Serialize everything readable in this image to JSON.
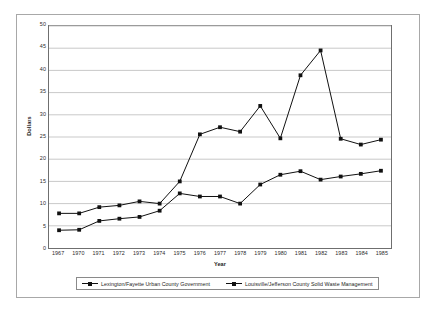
{
  "chart_data": {
    "type": "line",
    "title": "",
    "xlabel": "Year",
    "ylabel": "Dollars",
    "ylim": [
      0,
      50
    ],
    "ytick_step": 5,
    "yticks": [
      0,
      5,
      10,
      15,
      20,
      25,
      30,
      35,
      40,
      45,
      50
    ],
    "grid": true,
    "grid_axis": "y",
    "legend_position": "bottom",
    "categories": [
      "1967",
      "1970",
      "1971",
      "1972",
      "1973",
      "1974",
      "1975",
      "1976",
      "1977",
      "1978",
      "1979",
      "1980",
      "1981",
      "1982",
      "1983",
      "1984",
      "1985"
    ],
    "series": [
      {
        "name": "Lexington/Fayette Urban County Government",
        "color": "#111111",
        "marker": "square",
        "values": [
          4.0,
          4.1,
          6.1,
          6.6,
          7.0,
          8.4,
          12.3,
          11.6,
          11.6,
          10.0,
          14.3,
          16.5,
          17.3,
          15.4,
          16.1,
          16.7,
          17.4
        ]
      },
      {
        "name": "Louisville/Jefferson County Solid Waste Management",
        "color": "#111111",
        "marker": "square",
        "values": [
          7.8,
          7.8,
          9.2,
          9.6,
          10.5,
          10.0,
          15.0,
          25.6,
          27.2,
          26.2,
          32.0,
          24.7,
          38.9,
          44.5,
          24.6,
          23.3,
          24.4
        ]
      }
    ]
  },
  "axis": {
    "y_title": "Dollars",
    "x_title": "Year"
  },
  "legend": {
    "items": [
      {
        "label": "Lexington/Fayette Urban County Government"
      },
      {
        "label": "Louisville/Jefferson County Solid Waste Management"
      }
    ]
  }
}
